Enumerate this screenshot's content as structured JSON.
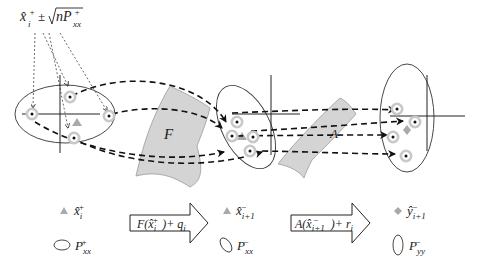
{
  "figure": {
    "top_formula": {
      "base": "x̂",
      "sub": "i",
      "sup": "+",
      "op": "±",
      "sqrt_arg": "nP",
      "sqrt_sub": "xx",
      "sqrt_sup": "+"
    },
    "transform_labels": {
      "F": "F",
      "A": "A"
    },
    "colors": {
      "ink": "#222222",
      "surface_fill": "#d4d4d4",
      "surface_stroke": "#9a9a9a",
      "sigma_ring": "#c8c8c8",
      "marker": "#a9a9a9"
    }
  },
  "legend": {
    "items": [
      {
        "symbol": "triangle",
        "base": "x̂",
        "sub": "i",
        "sup": "+"
      },
      {
        "symbol": "ellipse-horizontal",
        "base": "P",
        "sub": "xx",
        "sup": "+"
      },
      {
        "symbol": "triangle",
        "base": "x̂",
        "sub": "i+1",
        "sup": "−"
      },
      {
        "symbol": "ellipse-tilted",
        "base": "P",
        "sub": "xx",
        "sup": "−"
      },
      {
        "symbol": "diamond",
        "base": "ŷ",
        "sub": "i+1",
        "sup": "−"
      },
      {
        "symbol": "ellipse-vertical",
        "base": "P",
        "sub": "yy",
        "sup": "−"
      }
    ],
    "arrows": [
      {
        "text_pre": "F(x̂",
        "text_sub": "i",
        "text_sup": "+",
        "text_post": ")+ q",
        "text_post_sub": "i"
      },
      {
        "text_pre": "A(x̂",
        "text_sub": "i+1",
        "text_sup": "−",
        "text_post": ")+ r",
        "text_post_sub": "i"
      }
    ]
  }
}
